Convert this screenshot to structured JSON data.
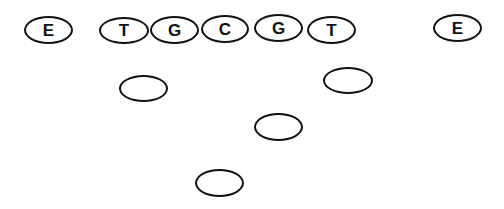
{
  "diagram": {
    "title": "",
    "stroke_color": "#111111",
    "background": "#ffffff",
    "players": [
      {
        "id": "left-end",
        "label": "E",
        "x": 24,
        "y": 16,
        "w": 49,
        "h": 28
      },
      {
        "id": "left-tackle",
        "label": "T",
        "x": 99,
        "y": 17,
        "w": 50,
        "h": 27
      },
      {
        "id": "left-guard",
        "label": "G",
        "x": 150,
        "y": 16,
        "w": 49,
        "h": 28
      },
      {
        "id": "center",
        "label": "C",
        "x": 201,
        "y": 15,
        "w": 48,
        "h": 28
      },
      {
        "id": "right-guard",
        "label": "G",
        "x": 254,
        "y": 14,
        "w": 49,
        "h": 28
      },
      {
        "id": "right-tackle",
        "label": "T",
        "x": 307,
        "y": 16,
        "w": 49,
        "h": 28
      },
      {
        "id": "right-end",
        "label": "E",
        "x": 433,
        "y": 14,
        "w": 49,
        "h": 28
      },
      {
        "id": "left-back",
        "label": "",
        "x": 119,
        "y": 75,
        "w": 49,
        "h": 27
      },
      {
        "id": "right-back",
        "label": "",
        "x": 323,
        "y": 67,
        "w": 50,
        "h": 27
      },
      {
        "id": "middle-back",
        "label": "",
        "x": 254,
        "y": 113,
        "w": 49,
        "h": 28
      },
      {
        "id": "deep-back",
        "label": "",
        "x": 195,
        "y": 169,
        "w": 49,
        "h": 28
      }
    ]
  }
}
